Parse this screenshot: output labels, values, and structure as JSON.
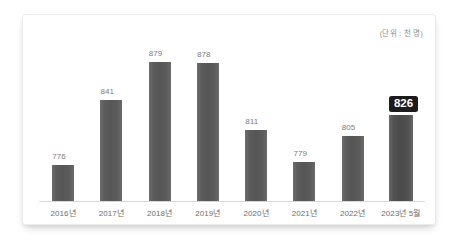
{
  "unit_note": "(단위 : 천 명)",
  "chart_data": {
    "type": "bar",
    "title": "",
    "subtitle": "",
    "xlabel": "",
    "ylabel": "",
    "unit_note": "(단위 : 천 명)",
    "grid": false,
    "legend": "none",
    "ylim": [
      740,
      890
    ],
    "categories": [
      "2016년",
      "2017년",
      "2018년",
      "2019년",
      "2020년",
      "2021년",
      "2022년",
      "2023년 5월"
    ],
    "values": [
      776,
      841,
      879,
      878,
      811,
      779,
      805,
      826
    ],
    "value_labels": [
      "776",
      "841",
      "879",
      "878",
      "811",
      "779",
      "805",
      "826"
    ],
    "highlight_index": 7,
    "colors": {
      "bar": "#585858",
      "bar_highlight": "#4c4c4c",
      "value_label": "#7b7b7b",
      "highlight_badge_bg": "#1c1c1c",
      "highlight_badge_text": "#ffffff",
      "axis_line": "#d8d8d8",
      "category_label": "#6d6d6d",
      "card_background": "#ffffff",
      "page_background": "#ffffff"
    }
  }
}
